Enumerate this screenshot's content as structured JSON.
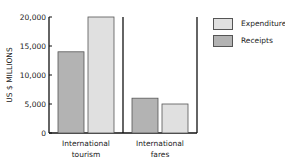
{
  "chart_data": {
    "type": "bar",
    "title": "",
    "xlabel": "",
    "ylabel": "US $ MILLIONS",
    "ylim": [
      0,
      20000
    ],
    "yticks": [
      0,
      5000,
      10000,
      15000,
      20000
    ],
    "ytick_labels": [
      "0",
      "5,000",
      "10,000",
      "15,000",
      "20,000"
    ],
    "categories": [
      {
        "line1": "International",
        "line2": "tourism"
      },
      {
        "line1": "International",
        "line2": "fares"
      }
    ],
    "series": [
      {
        "name": "Receipts",
        "color": "#b3b3b3",
        "values": [
          14000,
          6000
        ]
      },
      {
        "name": "Expenditure",
        "color": "#e0e0e0",
        "values": [
          20000,
          5000
        ]
      }
    ],
    "legend": {
      "position": "top-right",
      "items": [
        {
          "label": "Expenditure",
          "color": "#e0e0e0"
        },
        {
          "label": "Receipts",
          "color": "#b3b3b3"
        }
      ]
    },
    "grid": false
  }
}
